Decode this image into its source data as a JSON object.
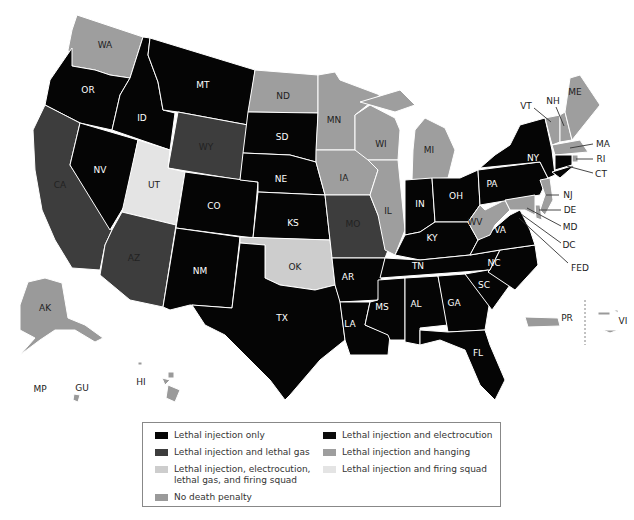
{
  "colors": {
    "lethal_injection_only": "#050505",
    "lethal_injection_electrocution": "#0c0c0c",
    "lethal_injection_lethal_gas": "#3d3d3d",
    "lethal_injection_hanging": "#9e9e9e",
    "lethal_injection_electrocution_gas_firing": "#cdcdcd",
    "lethal_injection_firing_squad": "#e4e4e4",
    "no_death_penalty": "#9a9a9a"
  },
  "legend": {
    "items": [
      {
        "key": "lethal_injection_only",
        "label": "Lethal injection only",
        "color": "#050505"
      },
      {
        "key": "lethal_injection_electrocution",
        "label": "Lethal injection and electrocution",
        "color": "#0c0c0c"
      },
      {
        "key": "lethal_injection_lethal_gas",
        "label": "Lethal injection and lethal gas",
        "color": "#3d3d3d"
      },
      {
        "key": "lethal_injection_hanging",
        "label": "Lethal injection and hanging",
        "color": "#9e9e9e"
      },
      {
        "key": "lethal_injection_electrocution_gas_firing",
        "label": "Lethal injection, electrocution,\nlethal gas, and firing squad",
        "color": "#cdcdcd"
      },
      {
        "key": "lethal_injection_firing_squad",
        "label": "Lethal injection and firing squad",
        "color": "#e4e4e4"
      },
      {
        "key": "no_death_penalty",
        "label": "No death penalty",
        "color": "#9a9a9a"
      }
    ]
  },
  "states": {
    "WA": "WA",
    "OR": "OR",
    "CA": "CA",
    "ID": "ID",
    "NV": "NV",
    "MT": "MT",
    "WY": "WY",
    "UT": "UT",
    "AZ": "AZ",
    "CO": "CO",
    "NM": "NM",
    "ND": "ND",
    "SD": "SD",
    "NE": "NE",
    "KS": "KS",
    "OK": "OK",
    "TX": "TX",
    "MN": "MN",
    "IA": "IA",
    "MO": "MO",
    "AR": "AR",
    "LA": "LA",
    "WI": "WI",
    "IL": "IL",
    "MI": "MI",
    "IN": "IN",
    "OH": "OH",
    "KY": "KY",
    "TN": "TN",
    "MS": "MS",
    "AL": "AL",
    "GA": "GA",
    "FL": "FL",
    "SC": "SC",
    "NC": "NC",
    "VA": "VA",
    "WV": "WV",
    "PA": "PA",
    "NY": "NY",
    "VT": "VT",
    "NH": "NH",
    "ME": "ME",
    "MA": "MA",
    "RI": "RI",
    "CT": "CT",
    "NJ": "NJ",
    "DE": "DE",
    "MD": "MD",
    "DC": "DC",
    "FED": "FED",
    "AK": "AK",
    "HI": "HI",
    "PR": "PR",
    "VI": "VI",
    "GU": "GU",
    "MP": "MP"
  }
}
